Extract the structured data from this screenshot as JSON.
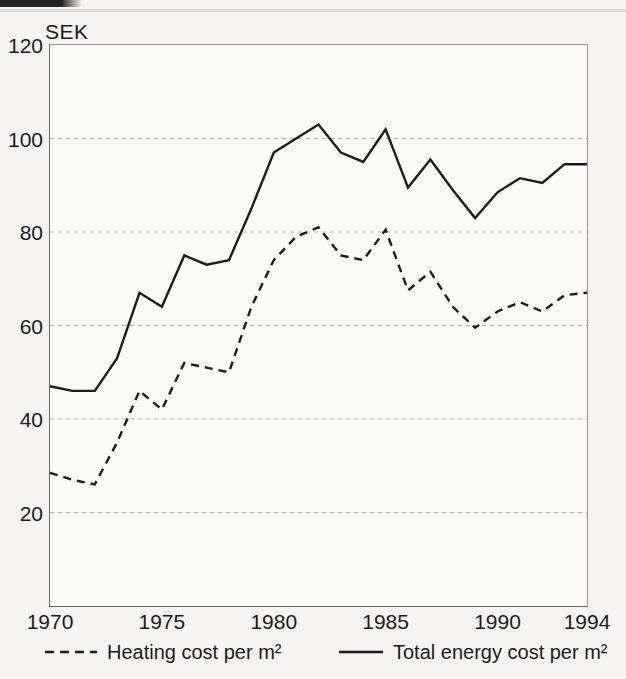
{
  "colors": {
    "line": "#1c1c1c",
    "grid": "#b3b1ad",
    "frame": "#979590",
    "paper": "#f5f4f1",
    "ink": "#1b1b1b"
  },
  "chart_data": {
    "type": "line",
    "title": "",
    "ylabel": "SEK",
    "xlabel": "",
    "xlim": [
      1970,
      1994
    ],
    "ylim": [
      0,
      120
    ],
    "x_ticks": [
      1970,
      1975,
      1980,
      1985,
      1990,
      1994
    ],
    "y_ticks": [
      20,
      40,
      60,
      80,
      100,
      120
    ],
    "grid_values": [
      20,
      40,
      60,
      80,
      100
    ],
    "grid": "horizontal-dashed",
    "legend_position": "bottom",
    "x": [
      1970,
      1971,
      1972,
      1973,
      1974,
      1975,
      1976,
      1977,
      1978,
      1979,
      1980,
      1981,
      1982,
      1983,
      1984,
      1985,
      1986,
      1987,
      1988,
      1989,
      1990,
      1991,
      1992,
      1993,
      1994
    ],
    "series": [
      {
        "name": "Heating cost per m²",
        "style": "dashed",
        "values": [
          28.5,
          27,
          26,
          35,
          46,
          42,
          52,
          51,
          50,
          64,
          74,
          79,
          81,
          75,
          74,
          80.5,
          67.5,
          71.5,
          64,
          59.5,
          63,
          65,
          63,
          66.5,
          67
        ]
      },
      {
        "name": "Total energy cost per m²",
        "style": "solid",
        "values": [
          47,
          46,
          46,
          53,
          67,
          64,
          75,
          73,
          74,
          85,
          97,
          100,
          103,
          97,
          95,
          102,
          89.5,
          95.5,
          89,
          83,
          88.5,
          91.5,
          90.5,
          94.5,
          94.5
        ]
      }
    ]
  }
}
